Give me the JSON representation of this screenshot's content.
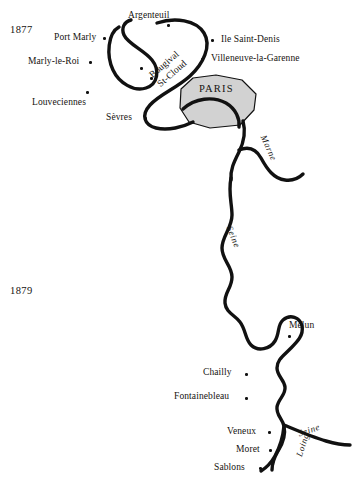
{
  "map": {
    "title": "Map of the Seine region near Paris",
    "colors": {
      "ink": "#111111",
      "paris_fill": "#d2d2d2",
      "paris_stroke": "#111111",
      "background": "#ffffff"
    },
    "years": [
      {
        "name": "year-1877",
        "text": "1877",
        "x": 10,
        "y": 25
      },
      {
        "name": "year-1879",
        "text": "1879",
        "x": 10,
        "y": 286
      }
    ],
    "region_label": {
      "text": "PARIS",
      "x": 199,
      "y": 84
    },
    "places": [
      {
        "name": "argenteuil",
        "text": "Argenteuil",
        "x": 128,
        "y": 11,
        "dot_x": 167,
        "dot_y": 24,
        "align": "left"
      },
      {
        "name": "port-marly",
        "text": "Port Marly",
        "x": 54,
        "y": 33,
        "dot_x": 103,
        "dot_y": 37,
        "align": "left"
      },
      {
        "name": "ile-saint-denis",
        "text": "Ile Saint-Denis",
        "x": 221,
        "y": 35,
        "dot_x": 211,
        "dot_y": 39,
        "align": "left"
      },
      {
        "name": "marly-le-roi",
        "text": "Marly-le-Roi",
        "x": 28,
        "y": 57,
        "dot_x": 89,
        "dot_y": 61,
        "align": "left"
      },
      {
        "name": "villeneuve-la-garenne",
        "text": "Villeneuve-la-Garenne",
        "x": 211,
        "y": 54,
        "dot_x": 201,
        "dot_y": 58,
        "align": "left"
      },
      {
        "name": "louveciennes",
        "text": "Louveciennes",
        "x": 32,
        "y": 98,
        "dot_x": 86,
        "dot_y": 91,
        "align": "left"
      },
      {
        "name": "sevres",
        "text": "Sèvres",
        "x": 106,
        "y": 113,
        "dot_x": 144,
        "dot_y": 117,
        "align": "left"
      },
      {
        "name": "melun",
        "text": "Melun",
        "x": 289,
        "y": 321,
        "dot_x": 288,
        "dot_y": 335,
        "align": "left"
      },
      {
        "name": "chailly",
        "text": "Chailly",
        "x": 203,
        "y": 368,
        "dot_x": 245,
        "dot_y": 373,
        "align": "left"
      },
      {
        "name": "fontainebleau",
        "text": "Fontainebleau",
        "x": 174,
        "y": 392,
        "dot_x": 245,
        "dot_y": 397,
        "align": "left"
      },
      {
        "name": "veneux",
        "text": "Veneux",
        "x": 227,
        "y": 427,
        "dot_x": 268,
        "dot_y": 431,
        "align": "left"
      },
      {
        "name": "moret",
        "text": "Moret",
        "x": 236,
        "y": 445,
        "dot_x": 269,
        "dot_y": 449,
        "align": "left"
      },
      {
        "name": "sablons",
        "text": "Sablons",
        "x": 214,
        "y": 463,
        "dot_x": 259,
        "dot_y": 467,
        "align": "left"
      }
    ],
    "rotated_places": [
      {
        "name": "bougival",
        "text": "Bougival",
        "x": 148,
        "y": 73,
        "rotate": -41,
        "dot_x": 140,
        "dot_y": 67
      },
      {
        "name": "st-cloud",
        "text": "St-Cloud",
        "x": 156,
        "y": 82,
        "rotate": -41,
        "dot_x": 150,
        "dot_y": 77
      }
    ],
    "rivers": [
      {
        "name": "marne-label",
        "text": "Marne",
        "x": 267,
        "y": 134,
        "rotate": 66
      },
      {
        "name": "seine-label-middle",
        "text": "Seine",
        "x": 233,
        "y": 225,
        "rotate": 68
      },
      {
        "name": "seine-label-south",
        "text": "Seine",
        "x": 297,
        "y": 430,
        "rotate": -19
      },
      {
        "name": "loing-label",
        "text": "Loing",
        "x": 295,
        "y": 455,
        "rotate": -72
      }
    ]
  }
}
